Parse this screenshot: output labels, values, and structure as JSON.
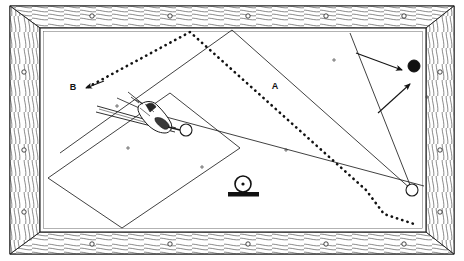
{
  "figure": {
    "kind": "billiards-table-shot-diagram",
    "style": "line-engraving",
    "width": 464,
    "height": 261,
    "background_color": "#ffffff",
    "ink_color": "#1a1a1a",
    "labels": [
      {
        "id": "label-a",
        "text": "A",
        "x": 275,
        "y": 89
      },
      {
        "id": "label-b",
        "text": "B",
        "x": 73,
        "y": 90
      }
    ],
    "frame": {
      "name": "wooden-table-frame",
      "outer": {
        "x": 10,
        "y": 6,
        "width": 444,
        "height": 248
      },
      "inner_bed": {
        "x": 40,
        "y": 28,
        "width": 386,
        "height": 204
      },
      "rail_thickness": 22,
      "stud_count_top": 5,
      "stud_count_bottom": 5,
      "stud_count_left": 3,
      "stud_count_right": 3,
      "grain_lines": 9
    },
    "balls": [
      {
        "id": "object-ball-black",
        "fill": "solid",
        "x": 414,
        "y": 66,
        "r": 6
      },
      {
        "id": "cue-ball-white",
        "fill": "hollow",
        "x": 186,
        "y": 130,
        "r": 6
      },
      {
        "id": "target-ball-white",
        "fill": "hollow",
        "x": 412,
        "y": 190,
        "r": 6
      }
    ],
    "solid_paths": [
      {
        "id": "cue-line-main",
        "points": "140,110 424,186"
      },
      {
        "id": "bank-line-upper",
        "points": "232,30 60,153"
      },
      {
        "id": "bank-line-mid",
        "points": "232,30 412,190"
      },
      {
        "id": "bank-line-right",
        "points": "350,33 412,190"
      },
      {
        "id": "long-rect-left",
        "points": "48,178 170,93 240,148 122,228 48,178"
      }
    ],
    "dotted_paths": [
      {
        "id": "dotted-to-B",
        "points": "86,87 190,32 366,190 384,214 414,224"
      }
    ],
    "arrows": [
      {
        "id": "arrow-to-B",
        "from": "102,82",
        "to": "84,88"
      },
      {
        "id": "arrow-to-black-ball",
        "from": "356,53",
        "to": "404,70"
      },
      {
        "id": "arrow-aim-lower",
        "from": "378,113",
        "to": "412,82"
      }
    ],
    "cue_and_hand": {
      "name": "hand-bridging-cue",
      "cue_from": "96,108",
      "cue_to": "186,130",
      "bridge_x": 152,
      "bridge_y": 120
    },
    "ball_on_stand_icon": {
      "name": "ball-on-rest-icon",
      "x": 243,
      "y": 188,
      "ball_r": 8,
      "base_width": 30,
      "base_height": 4
    },
    "spot_marks": [
      {
        "x": 128,
        "y": 148
      },
      {
        "x": 117,
        "y": 106
      },
      {
        "x": 202,
        "y": 167
      },
      {
        "x": 286,
        "y": 150
      },
      {
        "x": 334,
        "y": 60
      },
      {
        "x": 427,
        "y": 97
      }
    ]
  }
}
